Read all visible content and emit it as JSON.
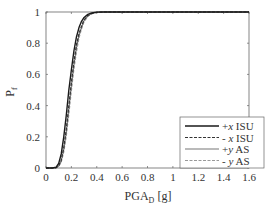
{
  "chart_data": {
    "type": "line",
    "title": "",
    "xlabel": "PGA_D [g]",
    "xlabel_main": "PGA",
    "xlabel_sub": "D",
    "xlabel_unit": "[g]",
    "ylabel": "P_f",
    "ylabel_main": "P",
    "ylabel_sub": "f",
    "xlim": [
      0,
      1.6
    ],
    "ylim": [
      0,
      1
    ],
    "xticks": [
      "0",
      "0.2",
      "0.4",
      "0.6",
      "0.8",
      "1",
      "1.2",
      "1.4",
      "1.6"
    ],
    "yticks": [
      "0",
      "0.2",
      "0.4",
      "0.6",
      "0.8",
      "1"
    ],
    "grid": false,
    "legend_position": "lower right",
    "x": [
      0,
      0.05,
      0.08,
      0.1,
      0.12,
      0.14,
      0.16,
      0.18,
      0.2,
      0.22,
      0.24,
      0.26,
      0.28,
      0.3,
      0.33,
      0.36,
      0.4,
      0.45,
      0.5,
      0.6,
      0.8,
      1.0,
      1.2,
      1.4,
      1.6
    ],
    "series": [
      {
        "name": "+x ISU",
        "style": "solid",
        "color": "#1a1a1a",
        "width": 1.4,
        "values": [
          0,
          0.0,
          0.005,
          0.03,
          0.09,
          0.2,
          0.34,
          0.5,
          0.63,
          0.75,
          0.84,
          0.9,
          0.94,
          0.965,
          0.985,
          0.994,
          0.999,
          1,
          1,
          1,
          1,
          1,
          1,
          1,
          1
        ]
      },
      {
        "name": "- x ISU",
        "style": "dashed",
        "color": "#333333",
        "width": 1.2,
        "values": [
          0,
          0.0,
          0.002,
          0.015,
          0.05,
          0.13,
          0.25,
          0.4,
          0.55,
          0.68,
          0.79,
          0.86,
          0.91,
          0.95,
          0.978,
          0.99,
          0.998,
          1,
          1,
          1,
          1,
          1,
          1,
          1,
          1
        ]
      },
      {
        "name": "+y AS",
        "style": "solid",
        "color": "#777777",
        "width": 1.1,
        "values": [
          0,
          0.0,
          0.002,
          0.012,
          0.045,
          0.12,
          0.23,
          0.38,
          0.53,
          0.66,
          0.77,
          0.85,
          0.9,
          0.945,
          0.975,
          0.99,
          0.998,
          1,
          1,
          1,
          1,
          1,
          1,
          1,
          1
        ]
      },
      {
        "name": "- y AS",
        "style": "dashed",
        "color": "#999999",
        "width": 1.0,
        "values": [
          0,
          0.0,
          0.001,
          0.008,
          0.035,
          0.1,
          0.2,
          0.34,
          0.49,
          0.63,
          0.74,
          0.83,
          0.89,
          0.935,
          0.97,
          0.988,
          0.997,
          1,
          1,
          1,
          1,
          1,
          1,
          1,
          1
        ]
      }
    ]
  },
  "legend": {
    "items": [
      {
        "label_sign": "+",
        "label_var": "x",
        "label_rest": " ISU"
      },
      {
        "label_sign": "- ",
        "label_var": "x",
        "label_rest": " ISU"
      },
      {
        "label_sign": "+",
        "label_var": "y",
        "label_rest": " AS"
      },
      {
        "label_sign": "- ",
        "label_var": "y",
        "label_rest": " AS"
      }
    ]
  }
}
